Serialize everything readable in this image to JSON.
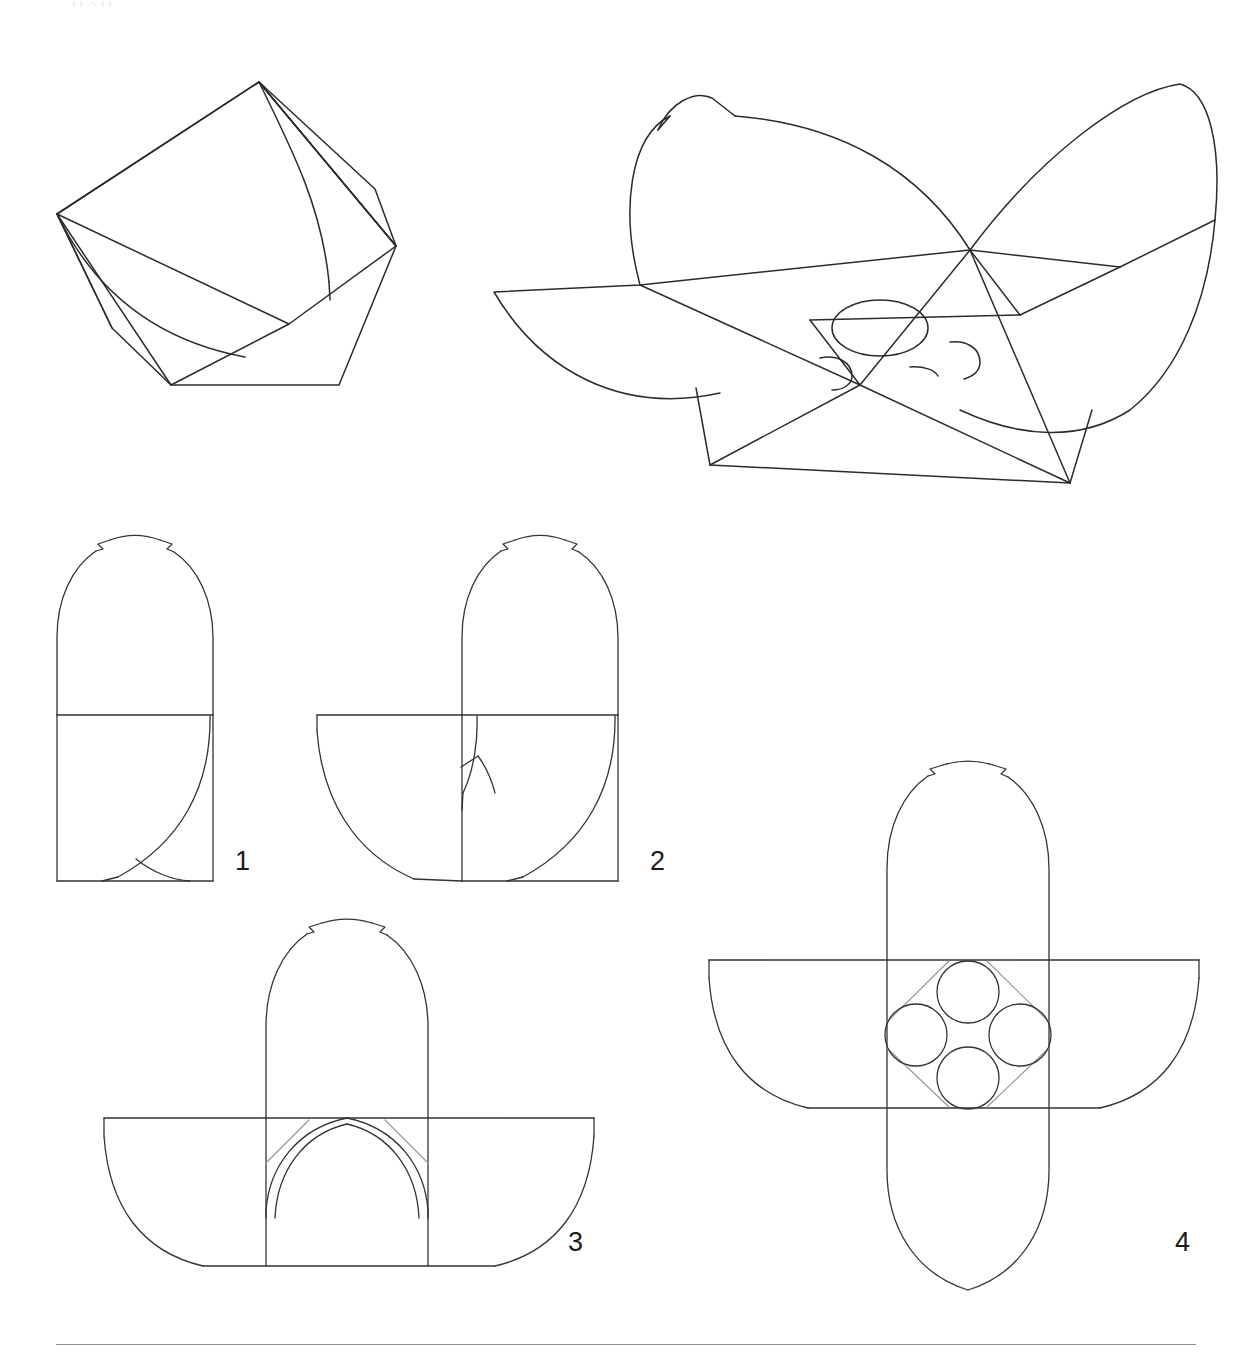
{
  "sheet": {
    "width": 1253,
    "height": 1362,
    "background": "#ffffff",
    "line_color": "#2b2b2b",
    "guide_color": "#9a9a9a",
    "rule_color": "#8d8d8d"
  },
  "figures": [
    {
      "id": "perspective-folded-view-upper-left",
      "label": "",
      "description": "Perspective view of folded container: faceted polygon body with curved fold line",
      "bbox": [
        50,
        70,
        420,
        400
      ]
    },
    {
      "id": "perspective-open-view-upper-right",
      "label": "",
      "description": "Perspective view of opened container: two curved petal flaps crossing, with four elliptical apertures at the base",
      "bbox": [
        490,
        80,
        1210,
        490
      ]
    },
    {
      "id": "flat-blank-stage-1",
      "label": "1",
      "label_pos": [
        236,
        863
      ],
      "description": "Flat blank, stage 1: arched dome panel above square base panel with single quarter-arc fold",
      "bbox": [
        57,
        540,
        228,
        882
      ]
    },
    {
      "id": "flat-blank-stage-2",
      "label": "2",
      "label_pos": [
        651,
        863
      ],
      "description": "Flat blank, stage 2: arched dome panel with square base plus left side wing flap",
      "bbox": [
        317,
        540,
        633,
        882
      ]
    },
    {
      "id": "flat-blank-stage-3",
      "label": "3",
      "label_pos": [
        570,
        1244
      ],
      "description": "Flat blank, stage 3: arched dome panel centered over symmetric bowl band with guide diagonals",
      "bbox": [
        104,
        930,
        594,
        1284
      ]
    },
    {
      "id": "flat-blank-stage-4",
      "label": "4",
      "label_pos": [
        1177,
        1244
      ],
      "description": "Flat blank, stage 4: full capsule panel crossing bowl band, with four circular apertures in diamond arrangement",
      "bbox": [
        712,
        772,
        1201,
        1290
      ]
    }
  ],
  "footer": {
    "rule": true,
    "rule_left": 56,
    "rule_top": 1344,
    "rule_width": 1140
  },
  "geometry": {
    "stage1": {
      "square_left": 57,
      "square_right": 228,
      "square_top": 714,
      "square_bottom": 881,
      "dome_top": 540,
      "notch_count": 2
    },
    "stage2": {
      "square_left": 462,
      "square_right": 633,
      "square_top": 714,
      "square_bottom": 881,
      "wing_left": 317,
      "dome_top": 540
    },
    "stage3": {
      "panel_left": 266,
      "panel_right": 437,
      "band_left": 104,
      "band_right": 594,
      "band_top": 1118,
      "band_bottom": 1267,
      "dome_top": 930,
      "apertures": 0
    },
    "stage4": {
      "panel_left": 893,
      "panel_right": 1065,
      "band_left": 712,
      "band_right": 1201,
      "band_top": 960,
      "band_bottom": 1110,
      "capsule_top": 772,
      "capsule_bottom": 1290,
      "apertures": 4,
      "aperture_radius": 31
    }
  }
}
